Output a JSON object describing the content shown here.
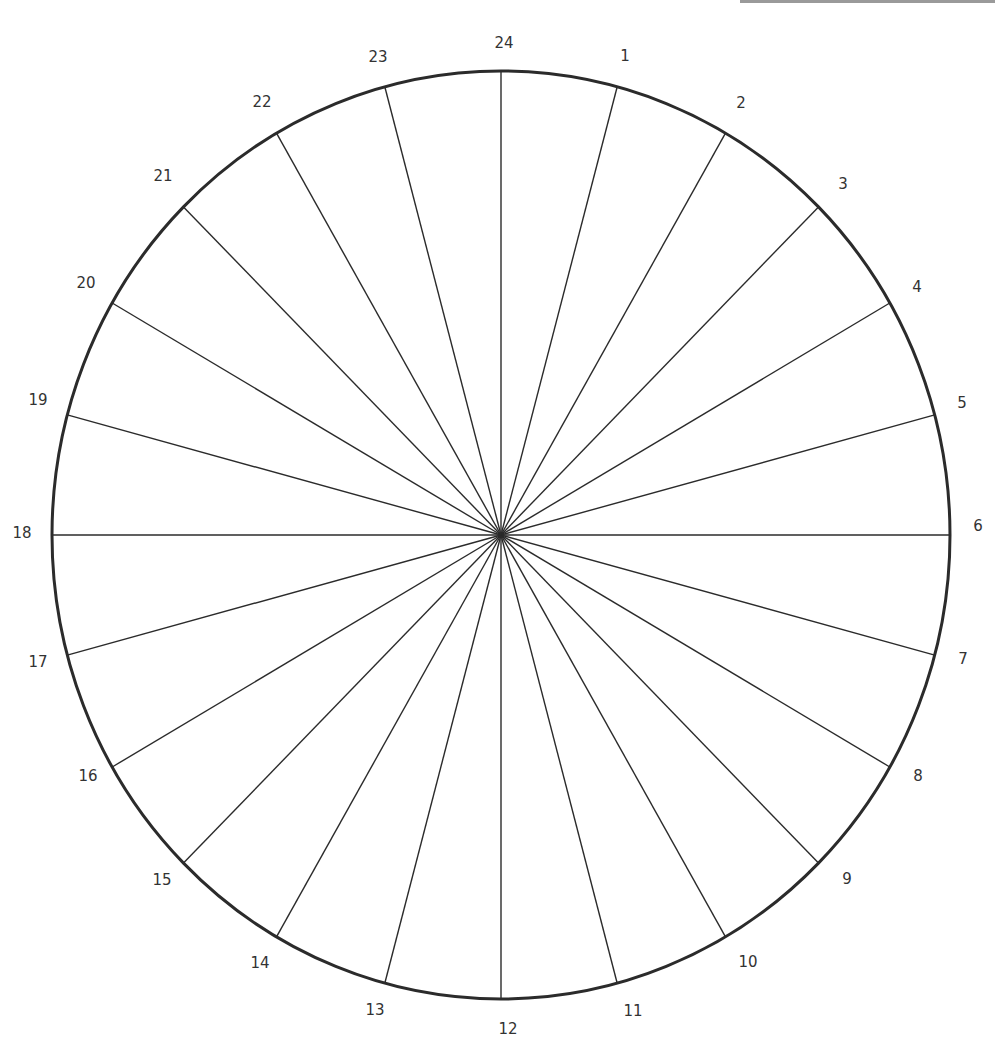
{
  "diagram": {
    "type": "radial-24-segment-wheel",
    "center": [
      501,
      535
    ],
    "radius_x": 449,
    "radius_y": 464,
    "segments": 24,
    "stroke_color": "#2b2b2b",
    "labels": [
      {
        "text": "24",
        "x": 504,
        "y": 43
      },
      {
        "text": "1",
        "x": 625,
        "y": 56
      },
      {
        "text": "2",
        "x": 741,
        "y": 103
      },
      {
        "text": "3",
        "x": 843,
        "y": 184
      },
      {
        "text": "4",
        "x": 917,
        "y": 287
      },
      {
        "text": "5",
        "x": 962,
        "y": 403
      },
      {
        "text": "6",
        "x": 978,
        "y": 526
      },
      {
        "text": "7",
        "x": 963,
        "y": 659
      },
      {
        "text": "8",
        "x": 918,
        "y": 776
      },
      {
        "text": "9",
        "x": 847,
        "y": 879
      },
      {
        "text": "10",
        "x": 748,
        "y": 962
      },
      {
        "text": "11",
        "x": 633,
        "y": 1011
      },
      {
        "text": "12",
        "x": 508,
        "y": 1029
      },
      {
        "text": "13",
        "x": 375,
        "y": 1010
      },
      {
        "text": "14",
        "x": 260,
        "y": 963
      },
      {
        "text": "15",
        "x": 162,
        "y": 880
      },
      {
        "text": "16",
        "x": 88,
        "y": 776
      },
      {
        "text": "17",
        "x": 38,
        "y": 662
      },
      {
        "text": "18",
        "x": 22,
        "y": 533
      },
      {
        "text": "19",
        "x": 38,
        "y": 400
      },
      {
        "text": "20",
        "x": 86,
        "y": 283
      },
      {
        "text": "21",
        "x": 163,
        "y": 176
      },
      {
        "text": "22",
        "x": 262,
        "y": 102
      },
      {
        "text": "23",
        "x": 378,
        "y": 57
      }
    ]
  }
}
